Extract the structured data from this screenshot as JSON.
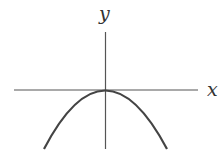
{
  "diagram": {
    "type": "function-graph",
    "axes": {
      "x_label": "x",
      "y_label": "y"
    },
    "curve": {
      "shape": "parabola",
      "opens": "down",
      "vertex": "origin"
    },
    "colors": {
      "axis": "#555555",
      "curve": "#444444",
      "label": "#333333",
      "background": "#ffffff"
    }
  }
}
